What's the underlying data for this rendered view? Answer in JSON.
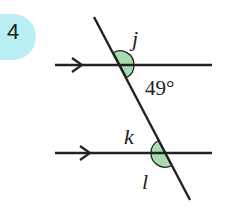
{
  "problem": {
    "number": "4",
    "badge_color": "#b9eef2"
  },
  "diagram": {
    "type": "parallel-lines-transversal",
    "angle_fill": "#a8dcb0",
    "line_color": "#222222",
    "labels": {
      "j": "j",
      "given": "49°",
      "k": "k",
      "l": "l"
    }
  }
}
